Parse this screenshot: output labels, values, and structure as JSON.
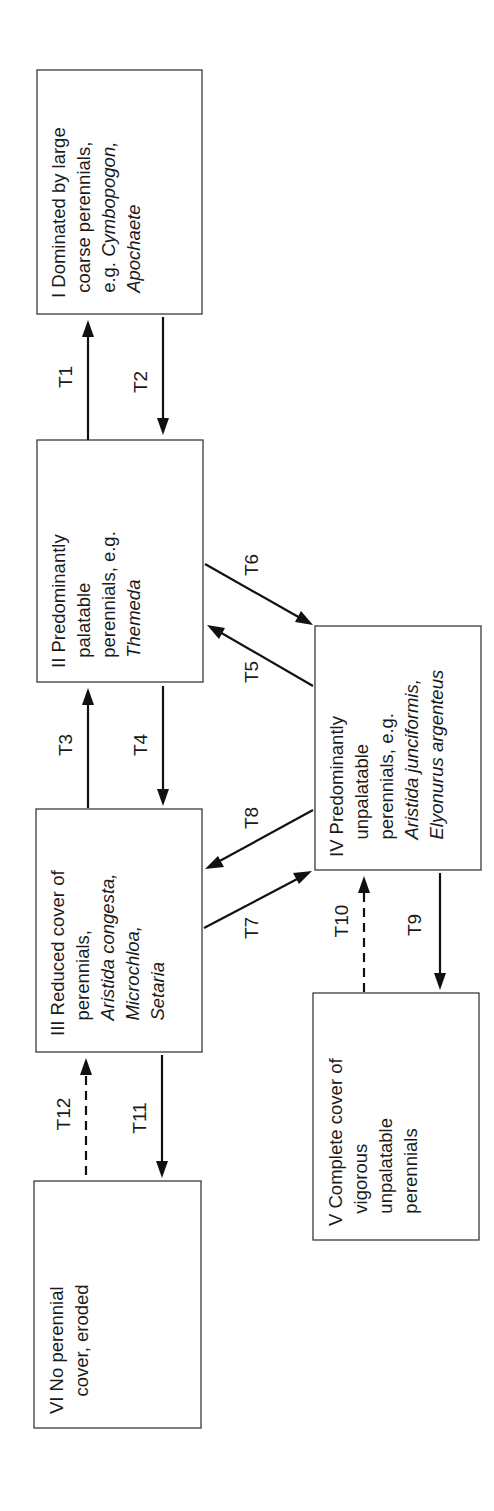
{
  "diagram": {
    "states": [
      {
        "id": "I",
        "numeral": "I",
        "lines": [
          [
            {
              "t": "Dominated by large",
              "i": false
            }
          ],
          [
            {
              "t": "coarse perennials,",
              "i": false
            }
          ],
          [
            {
              "t": "e.g. ",
              "i": false
            },
            {
              "t": "Cymbopogon,",
              "i": true
            }
          ],
          [
            {
              "t": "Apochaete",
              "i": true
            }
          ]
        ]
      },
      {
        "id": "II",
        "numeral": "II",
        "lines": [
          [
            {
              "t": "Predominantly",
              "i": false
            }
          ],
          [
            {
              "t": "palatable",
              "i": false
            }
          ],
          [
            {
              "t": "perennials, e.g.",
              "i": false
            }
          ],
          [
            {
              "t": "Themeda",
              "i": true
            }
          ]
        ]
      },
      {
        "id": "III",
        "numeral": "III",
        "lines": [
          [
            {
              "t": "Reduced cover of",
              "i": false
            }
          ],
          [
            {
              "t": "perennials,",
              "i": false
            }
          ],
          [
            {
              "t": "Aristida congesta,",
              "i": true
            }
          ],
          [
            {
              "t": "Microchloa,",
              "i": true
            }
          ],
          [
            {
              "t": "Setaria",
              "i": true
            }
          ]
        ]
      },
      {
        "id": "IV",
        "numeral": "IV",
        "lines": [
          [
            {
              "t": "Predominantly",
              "i": false
            }
          ],
          [
            {
              "t": "unpalatable",
              "i": false
            }
          ],
          [
            {
              "t": "perennials, e.g.",
              "i": false
            }
          ],
          [
            {
              "t": "Aristida junciformis,",
              "i": true
            }
          ],
          [
            {
              "t": "Elyonurus argenteus",
              "i": true
            }
          ]
        ]
      },
      {
        "id": "V",
        "numeral": "V",
        "lines": [
          [
            {
              "t": "Complete cover of",
              "i": false
            }
          ],
          [
            {
              "t": "vigorous",
              "i": false
            }
          ],
          [
            {
              "t": "unpalatable",
              "i": false
            }
          ],
          [
            {
              "t": "perennials",
              "i": false
            }
          ]
        ]
      },
      {
        "id": "VI",
        "numeral": "VI",
        "lines": [
          [
            {
              "t": "No perennial",
              "i": false
            }
          ],
          [
            {
              "t": "cover, eroded",
              "i": false
            }
          ]
        ]
      }
    ],
    "transitions": [
      {
        "label": "T1",
        "from": "II",
        "to": "I",
        "style": "solid"
      },
      {
        "label": "T2",
        "from": "I",
        "to": "II",
        "style": "solid"
      },
      {
        "label": "T3",
        "from": "III",
        "to": "II",
        "style": "solid"
      },
      {
        "label": "T4",
        "from": "II",
        "to": "III",
        "style": "solid"
      },
      {
        "label": "T5",
        "from": "IV",
        "to": "II",
        "style": "solid"
      },
      {
        "label": "T6",
        "from": "II",
        "to": "IV",
        "style": "solid"
      },
      {
        "label": "T7",
        "from": "III",
        "to": "IV",
        "style": "solid"
      },
      {
        "label": "T8",
        "from": "IV",
        "to": "III",
        "style": "solid"
      },
      {
        "label": "T9",
        "from": "IV",
        "to": "V",
        "style": "solid"
      },
      {
        "label": "T10",
        "from": "V",
        "to": "IV",
        "style": "dashed"
      },
      {
        "label": "T11",
        "from": "III",
        "to": "VI",
        "style": "solid"
      },
      {
        "label": "T12",
        "from": "VI",
        "to": "III",
        "style": "dashed"
      }
    ],
    "colors": {
      "line": "#111111",
      "box_border": "#3a3a3a",
      "text": "#1a1a1a",
      "background": "#ffffff"
    }
  }
}
